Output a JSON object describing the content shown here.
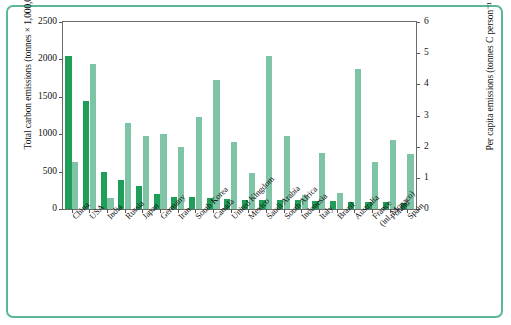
{
  "axes": {
    "left_title": "Total carbon emissions (tonnes × 1,000,000)",
    "right_title": "Per capita emissions (tonnes C person⁻¹ y⁻¹)",
    "left_ticks": [
      "0",
      "500",
      "1000",
      "1500",
      "2000",
      "2500"
    ],
    "right_ticks": [
      "0",
      "1",
      "2",
      "3",
      "4",
      "5",
      "6"
    ]
  },
  "colors": {
    "total_bar": "#1f9e5a",
    "per_capita_bar": "#7fc4a5",
    "frame": "#5cb79a",
    "axis": "#6b6b6b",
    "background": "#ffffff",
    "text": "#111111"
  },
  "chart_data": {
    "type": "bar",
    "title": "",
    "xlabel": "",
    "ylabel": "Total carbon emissions (tonnes × 1,000,000)",
    "y2label": "Per capita emissions (tonnes C person⁻¹ y⁻¹)",
    "ylim": [
      0,
      2500
    ],
    "y2lim": [
      0,
      6
    ],
    "grid": false,
    "legend": "none",
    "categories": [
      "China",
      "USA",
      "India",
      "Russia",
      "Japan",
      "Germany",
      "Iran",
      "South Korea",
      "Canada",
      "United Kingdom",
      "Mexico",
      "Saudi Arabia",
      "South Africa",
      "Indonesia",
      "Italy",
      "Brazil",
      "Australia",
      "France (inl. Monaco)",
      "Poland",
      "Spain"
    ],
    "series": [
      {
        "name": "Total carbon emissions",
        "axis": "left",
        "units": "tonnes × 1,000,000",
        "color": "#1f9e5a",
        "values": [
          2040,
          1440,
          500,
          385,
          310,
          195,
          160,
          155,
          145,
          135,
          125,
          120,
          120,
          115,
          110,
          105,
          100,
          95,
          90,
          85
        ]
      },
      {
        "name": "Per capita emissions",
        "axis": "right",
        "units": "tonnes C person⁻¹ y⁻¹",
        "color": "#7fc4a5",
        "values": [
          1.5,
          4.65,
          0.35,
          2.75,
          2.35,
          2.4,
          2.0,
          2.95,
          4.15,
          2.15,
          1.15,
          4.9,
          2.35,
          0.45,
          1.8,
          0.5,
          4.5,
          1.5,
          2.2,
          1.75
        ]
      }
    ]
  }
}
